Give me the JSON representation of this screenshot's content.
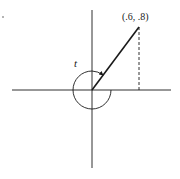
{
  "diagram": {
    "type": "unit-circle-angle",
    "point_label": "(.6, .8)",
    "angle_label": "t",
    "point": {
      "x": 0.6,
      "y": 0.8
    },
    "colors": {
      "ink": "#1a1a1a",
      "background": "#ffffff"
    }
  }
}
